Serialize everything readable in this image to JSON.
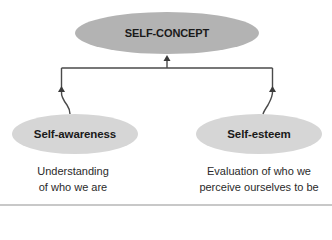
{
  "diagram": {
    "type": "hierarchy",
    "colors": {
      "root_fill": "#b3b3b3",
      "child_fill": "#d6d6d6",
      "line": "#4a4a4a",
      "text": "#1a1a1a",
      "rule": "#c8c8c8"
    },
    "root": {
      "label": "SELF-CONCEPT"
    },
    "children": [
      {
        "label": "Self-awareness",
        "description_line1": "Understanding",
        "description_line2": "of who we are"
      },
      {
        "label": "Self-esteem",
        "description_line1": "Evaluation of who we",
        "description_line2": "perceive ourselves to be"
      }
    ],
    "edges": [
      {
        "from": "Self-awareness",
        "to": "SELF-CONCEPT"
      },
      {
        "from": "Self-esteem",
        "to": "SELF-CONCEPT"
      }
    ]
  }
}
